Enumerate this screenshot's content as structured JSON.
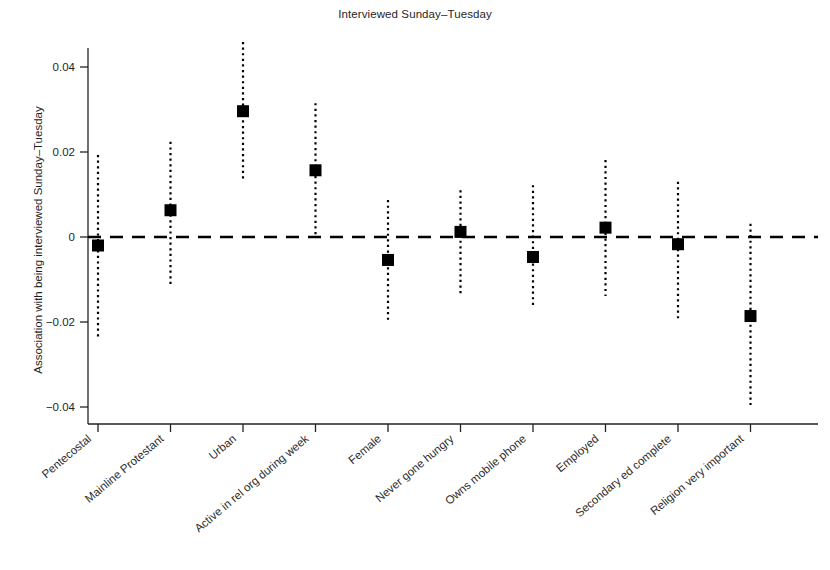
{
  "chart_data": {
    "type": "scatter",
    "title": "Interviewed Sunday–Tuesday",
    "xlabel": "",
    "ylabel": "Association with being interviewed Sunday–Tuesday",
    "ylim": [
      -0.048,
      0.049
    ],
    "yticks": [
      0.04,
      0.02,
      0,
      -0.02,
      -0.04
    ],
    "ytick_labels": [
      "0.04",
      "0.02",
      "0",
      "−0.02",
      "−0.04"
    ],
    "grid": false,
    "legend": null,
    "reference_line": 0,
    "categories": [
      "Pentecostal",
      "Mainline Protestant",
      "Urban",
      "Active in rel org during week",
      "Female",
      "Never gone hungry",
      "Owns mobile phone",
      "Employed",
      "Secondary ed complete",
      "Religion very important"
    ],
    "values": [
      -0.002,
      0.0063,
      0.0296,
      0.0157,
      -0.0054,
      0.0012,
      -0.0047,
      0.0022,
      -0.0017,
      -0.0186
    ],
    "ci_low": [
      -0.0242,
      -0.0112,
      0.0134,
      0.0,
      -0.0195,
      -0.0139,
      -0.0167,
      -0.0139,
      -0.0195,
      -0.0395
    ],
    "ci_high": [
      0.0193,
      0.0224,
      0.0459,
      0.0315,
      0.0087,
      0.011,
      0.0122,
      0.0181,
      0.013,
      0.0031
    ],
    "marker": "square",
    "marker_color": "#000000",
    "errorbar_style": "dotted",
    "reference_line_style": "dashed"
  }
}
